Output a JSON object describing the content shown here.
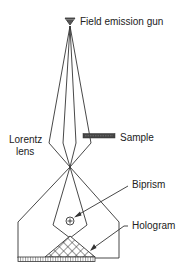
{
  "diagram": {
    "type": "electron holography schematic",
    "labels": {
      "gun": "Field emission gun",
      "sample": "Sample",
      "lens_line1": "Lorentz",
      "lens_line2": "lens",
      "biprism": "Biprism",
      "hologram": "Hologram"
    },
    "components": [
      {
        "name": "field-emission-gun",
        "icon": "triangle-down"
      },
      {
        "name": "sample",
        "icon": "dark-bar"
      },
      {
        "name": "lorentz-lens"
      },
      {
        "name": "biprism",
        "icon": "circled-plus"
      },
      {
        "name": "hologram",
        "icon": "crosshatch-triangle"
      },
      {
        "name": "detector",
        "icon": "hatched-strip"
      }
    ],
    "colors": {
      "line": "#333333",
      "sample": "#444444",
      "background": "#ffffff"
    }
  }
}
